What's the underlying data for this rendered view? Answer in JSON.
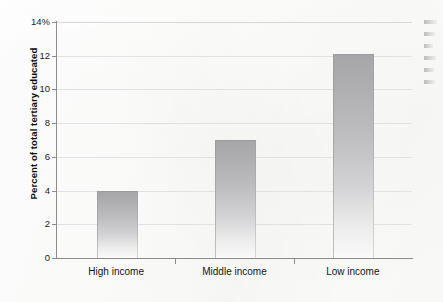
{
  "chart_data": {
    "type": "bar",
    "title": "",
    "subtitle": "",
    "xlabel": "",
    "ylabel": "Percent of total tertiary educated",
    "categories": [
      "High income",
      "Middle income",
      "Low income"
    ],
    "values": [
      4.0,
      7.0,
      12.1
    ],
    "ylim": [
      0,
      14
    ],
    "y_ticks": [
      0,
      2,
      4,
      6,
      8,
      10,
      12,
      14
    ],
    "y_tick_labels": [
      "0",
      "2",
      "4",
      "6",
      "8",
      "10",
      "12",
      "14%"
    ],
    "grid": "horizontal",
    "legend": "none",
    "annotations": [],
    "bar_color": "#b4b4b6",
    "gridline_color": "#e2e2e4",
    "axis_color": "#8c8c8c"
  },
  "axes": {
    "y_title": "Percent of total tertiary educated",
    "ticks_y": [
      {
        "label": "14%",
        "value": 14
      },
      {
        "label": "12",
        "value": 12
      },
      {
        "label": "10",
        "value": 10
      },
      {
        "label": "8",
        "value": 8
      },
      {
        "label": "6",
        "value": 6
      },
      {
        "label": "4",
        "value": 4
      },
      {
        "label": "2",
        "value": 2
      },
      {
        "label": "0",
        "value": 0
      }
    ],
    "categories": [
      {
        "label": "High income",
        "value": 4.0
      },
      {
        "label": "Middle income",
        "value": 7.0
      },
      {
        "label": "Low income",
        "value": 12.1
      }
    ]
  },
  "margin_notes": {
    "description": "illegible cut-off text fragments at right page edge",
    "line_count": 6
  }
}
